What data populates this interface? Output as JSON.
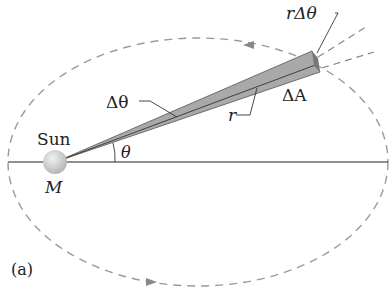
{
  "figure": {
    "panel_label": "(a)",
    "sun_label": "Sun",
    "mass_label": "M",
    "angle_label": "θ",
    "delta_angle_label": "Δθ",
    "radius_label": "r",
    "arc_label": "rΔθ",
    "area_label": "ΔA"
  },
  "colors": {
    "orbit": "#999999",
    "wedge_fill": "#a9a9a9",
    "line": "#222222",
    "sun": "#cfcfcf"
  }
}
